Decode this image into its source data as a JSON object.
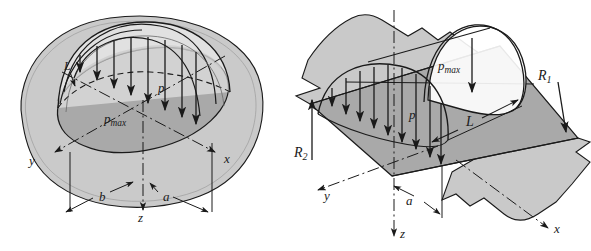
{
  "figure": {
    "background_color": "#ffffff",
    "line_color": "#1a1a1a",
    "fill_body_gray": "#c9c9c9",
    "fill_contact_gray": "#a8a8a8",
    "fill_dome_light": "#f2f2f2",
    "panels": [
      {
        "id": "left-panel",
        "name": "elliptical-contact-area",
        "description": "Point contact: semi-ellipsoidal pressure distribution over elliptical contact patch",
        "labels": [
          {
            "key": "p_max",
            "base": "p",
            "sub": "max",
            "x": 104,
            "y": 123
          },
          {
            "key": "p",
            "base": "p",
            "sub": "",
            "x": 158,
            "y": 92
          },
          {
            "key": "L",
            "base": "L",
            "sub": "",
            "x": 68,
            "y": 68
          },
          {
            "key": "y_axis",
            "base": "y",
            "sub": "",
            "x": 29,
            "y": 163
          },
          {
            "key": "x_axis",
            "base": "x",
            "sub": "",
            "x": 225,
            "y": 163
          },
          {
            "key": "b",
            "base": "b",
            "sub": "",
            "x": 100,
            "y": 199
          },
          {
            "key": "a",
            "base": "a",
            "sub": "",
            "x": 164,
            "y": 199
          },
          {
            "key": "z_axis",
            "base": "z",
            "sub": "",
            "x": 138,
            "y": 219
          }
        ]
      },
      {
        "id": "right-panel",
        "name": "line-contact-area",
        "description": "Line contact: semi-elliptical prismatic pressure distribution over rectangular contact strip between two cylinders",
        "labels": [
          {
            "key": "p_max",
            "base": "p",
            "sub": "max",
            "x": 445,
            "y": 68
          },
          {
            "key": "p",
            "base": "p",
            "sub": "",
            "x": 411,
            "y": 117
          },
          {
            "key": "L",
            "base": "L",
            "sub": "",
            "x": 470,
            "y": 122
          },
          {
            "key": "R1",
            "base": "R",
            "sub": "1",
            "x": 540,
            "y": 78
          },
          {
            "key": "R2",
            "base": "R",
            "sub": "2",
            "x": 296,
            "y": 153
          },
          {
            "key": "y_axis",
            "base": "y",
            "sub": "",
            "x": 324,
            "y": 195
          },
          {
            "key": "a",
            "base": "a",
            "sub": "",
            "x": 405,
            "y": 201
          },
          {
            "key": "x_axis",
            "base": "x",
            "sub": "",
            "x": 552,
            "y": 229
          },
          {
            "key": "z_axis",
            "base": "z",
            "sub": "",
            "x": 400,
            "y": 229
          }
        ]
      }
    ]
  }
}
